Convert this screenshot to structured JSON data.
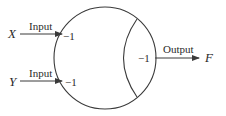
{
  "diagram": {
    "type": "neuron-like node",
    "inputs": [
      {
        "variable": "X",
        "label": "Input",
        "weight": "−1"
      },
      {
        "variable": "Y",
        "label": "Input",
        "weight": "−1"
      }
    ],
    "threshold": "−1",
    "output": {
      "variable": "F",
      "label": "Output"
    }
  },
  "colors": {
    "stroke": "#3a3a3a",
    "text": "#2a2a2a",
    "background": "#ffffff"
  }
}
